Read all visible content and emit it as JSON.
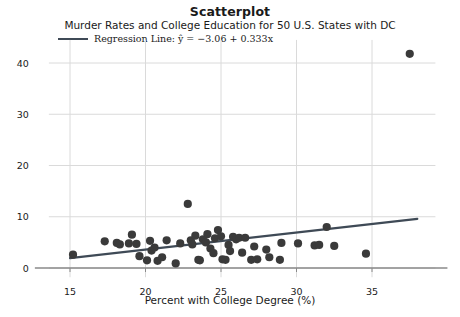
{
  "chart_data": {
    "type": "scatter",
    "title": "Scatterplot",
    "subtitle": "Murder Rates and College Education for 50 U.S. States with DC",
    "xlabel": "Percent with College Degree (%)",
    "ylabel": "Murder Rate (per 100,000)",
    "xlim": [
      13.6,
      39.2
    ],
    "ylim": [
      -1.8,
      44.5
    ],
    "xticks": [
      15,
      20,
      25,
      30,
      35
    ],
    "yticks": [
      0,
      10,
      20,
      30,
      40
    ],
    "grid": true,
    "legend_position": "above-axes-left",
    "marker_color": "#3a3a3a",
    "line_color": "#3f4a56",
    "grid_color": "#dadada",
    "legend": [
      {
        "label": "Regression Line: ŷ = −3.06 + 0.333x",
        "type": "line"
      }
    ],
    "regression": {
      "intercept": -3.06,
      "slope": 0.333,
      "x_start": 15.0,
      "x_end": 38.0
    },
    "points": [
      {
        "x": 15.2,
        "y": 2.6
      },
      {
        "x": 17.3,
        "y": 5.2
      },
      {
        "x": 18.1,
        "y": 4.9
      },
      {
        "x": 18.3,
        "y": 4.6
      },
      {
        "x": 18.9,
        "y": 4.8
      },
      {
        "x": 19.1,
        "y": 6.5
      },
      {
        "x": 19.4,
        "y": 4.7
      },
      {
        "x": 19.6,
        "y": 2.3
      },
      {
        "x": 20.1,
        "y": 1.5
      },
      {
        "x": 20.3,
        "y": 5.3
      },
      {
        "x": 20.4,
        "y": 3.4
      },
      {
        "x": 20.6,
        "y": 4.0
      },
      {
        "x": 20.8,
        "y": 1.4
      },
      {
        "x": 21.1,
        "y": 2.1
      },
      {
        "x": 21.4,
        "y": 5.4
      },
      {
        "x": 22.0,
        "y": 0.9
      },
      {
        "x": 22.3,
        "y": 4.8
      },
      {
        "x": 22.8,
        "y": 12.5
      },
      {
        "x": 23.0,
        "y": 5.4
      },
      {
        "x": 23.1,
        "y": 4.6
      },
      {
        "x": 23.3,
        "y": 6.3
      },
      {
        "x": 23.5,
        "y": 1.6
      },
      {
        "x": 23.6,
        "y": 1.5
      },
      {
        "x": 23.8,
        "y": 5.6
      },
      {
        "x": 24.0,
        "y": 5.0
      },
      {
        "x": 24.1,
        "y": 6.6
      },
      {
        "x": 24.3,
        "y": 3.8
      },
      {
        "x": 24.5,
        "y": 2.9
      },
      {
        "x": 24.6,
        "y": 5.8
      },
      {
        "x": 24.8,
        "y": 7.4
      },
      {
        "x": 25.0,
        "y": 6.2
      },
      {
        "x": 25.1,
        "y": 1.7
      },
      {
        "x": 25.3,
        "y": 1.6
      },
      {
        "x": 25.5,
        "y": 4.5
      },
      {
        "x": 25.6,
        "y": 3.3
      },
      {
        "x": 25.8,
        "y": 6.1
      },
      {
        "x": 26.0,
        "y": 5.6
      },
      {
        "x": 26.2,
        "y": 5.9
      },
      {
        "x": 26.4,
        "y": 3.0
      },
      {
        "x": 26.6,
        "y": 5.9
      },
      {
        "x": 27.0,
        "y": 1.6
      },
      {
        "x": 27.2,
        "y": 4.2
      },
      {
        "x": 27.4,
        "y": 1.7
      },
      {
        "x": 28.0,
        "y": 3.6
      },
      {
        "x": 28.2,
        "y": 2.1
      },
      {
        "x": 28.9,
        "y": 1.6
      },
      {
        "x": 29.0,
        "y": 4.9
      },
      {
        "x": 30.1,
        "y": 4.8
      },
      {
        "x": 31.2,
        "y": 4.4
      },
      {
        "x": 31.5,
        "y": 4.5
      },
      {
        "x": 32.0,
        "y": 8.0
      },
      {
        "x": 32.5,
        "y": 4.3
      },
      {
        "x": 34.6,
        "y": 2.8
      },
      {
        "x": 37.5,
        "y": 41.8
      }
    ]
  }
}
